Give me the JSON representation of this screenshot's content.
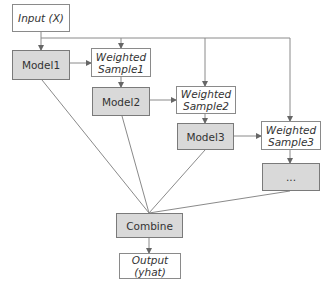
{
  "diagram": {
    "type": "flowchart",
    "title": "",
    "nodes": {
      "input": {
        "line1": "Input (X)",
        "line2": ""
      },
      "model1": {
        "label": "Model1"
      },
      "ws1": {
        "line1": "Weighted",
        "line2": "Sample1"
      },
      "model2": {
        "label": "Model2"
      },
      "ws2": {
        "line1": "Weighted",
        "line2": "Sample2"
      },
      "model3": {
        "label": "Model3"
      },
      "ws3": {
        "line1": "Weighted",
        "line2": "Sample3"
      },
      "more": {
        "label": "..."
      },
      "combine": {
        "label": "Combine"
      },
      "output": {
        "line1": "Output",
        "line2": "(yhat)"
      }
    },
    "edges": [
      {
        "from": "input",
        "to": "model1"
      },
      {
        "from": "input",
        "to": "ws1"
      },
      {
        "from": "input",
        "to": "ws2"
      },
      {
        "from": "input",
        "to": "ws3"
      },
      {
        "from": "model1",
        "to": "ws1"
      },
      {
        "from": "ws1",
        "to": "model2"
      },
      {
        "from": "model2",
        "to": "ws2"
      },
      {
        "from": "ws2",
        "to": "model3"
      },
      {
        "from": "model3",
        "to": "ws3"
      },
      {
        "from": "ws3",
        "to": "more"
      },
      {
        "from": "model1",
        "to": "combine"
      },
      {
        "from": "model2",
        "to": "combine"
      },
      {
        "from": "model3",
        "to": "combine"
      },
      {
        "from": "more",
        "to": "combine"
      },
      {
        "from": "combine",
        "to": "output"
      }
    ],
    "colors": {
      "model_fill": "#d9d9d9",
      "data_fill": "#ffffff",
      "stroke": "#8a8a8a",
      "text": "#333333"
    }
  }
}
